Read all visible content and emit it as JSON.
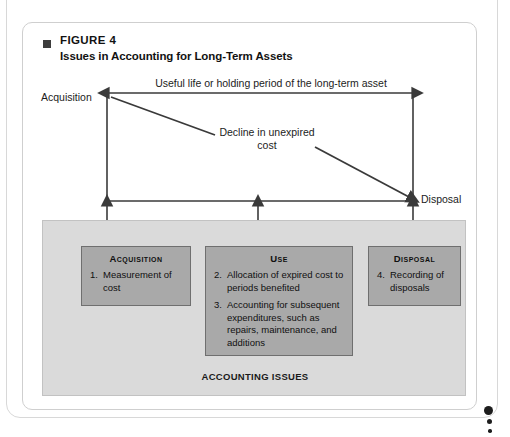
{
  "figure": {
    "label": "FIGURE 4",
    "title": "Issues in Accounting for Long-Term Assets",
    "bullet_icon": "filled-square-bullet-icon"
  },
  "diagram": {
    "useful_life_label": "Useful life or holding period of the long-term asset",
    "acquisition_label": "Acquisition",
    "disposal_label": "Disposal",
    "decline_label": "Decline in unexpired cost",
    "line_color": "#3a3a3a",
    "arrows": [
      {
        "name": "useful-life-double-arrow",
        "direction": "both"
      },
      {
        "name": "decline-diagonal-arrow",
        "direction": "right-down"
      },
      {
        "name": "acquisition-up-arrow",
        "direction": "up"
      },
      {
        "name": "use-up-arrow",
        "direction": "up"
      },
      {
        "name": "disposal-up-arrow",
        "direction": "up"
      }
    ]
  },
  "issues_panel": {
    "title": "ACCOUNTING ISSUES",
    "background_color": "#dadada",
    "box_color": "#a9a9a9",
    "boxes": [
      {
        "title": "Acquisition",
        "items": [
          {
            "number": "1.",
            "text": "Measurement of cost"
          }
        ]
      },
      {
        "title": "Use",
        "items": [
          {
            "number": "2.",
            "text": "Allocation of expired cost to periods benefited"
          },
          {
            "number": "3.",
            "text": "Accounting for subsequent expenditures, such as repairs, maintenance, and additions"
          }
        ]
      },
      {
        "title": "Disposal",
        "items": [
          {
            "number": "4.",
            "text": "Recording of disposals"
          }
        ]
      }
    ]
  },
  "margin_marks": {
    "dots": [
      "large-dot",
      "medium-dot",
      "small-dot"
    ]
  }
}
